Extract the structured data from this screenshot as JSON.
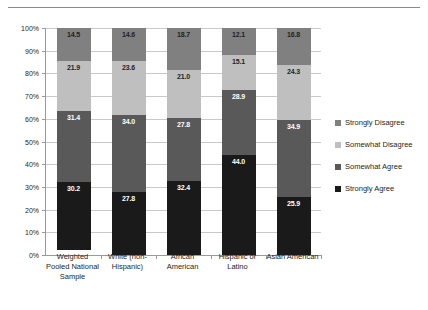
{
  "chart_data": {
    "type": "bar",
    "subtype": "stacked-100-percent-vertical",
    "title": "",
    "xlabel": "",
    "ylabel": "",
    "ylim": [
      0,
      100
    ],
    "ytick_labels": [
      "0%",
      "10%",
      "20%",
      "30%",
      "40%",
      "50%",
      "60%",
      "70%",
      "80%",
      "90%",
      "100%"
    ],
    "ytick_values": [
      0,
      10,
      20,
      30,
      40,
      50,
      60,
      70,
      80,
      90,
      100
    ],
    "grid": true,
    "legend_position": "right",
    "categories": [
      "Weighted Pooled National Sample",
      "White (non-Hispanic)",
      "African American",
      "Hispanic or Latino",
      "Asian American"
    ],
    "category_lines": [
      [
        "Weighted",
        "Pooled National",
        "Sample"
      ],
      [
        "White (non-",
        "Hispanic)"
      ],
      [
        "African",
        "American"
      ],
      [
        "Hispanic or",
        "Latino"
      ],
      [
        "Asian American"
      ]
    ],
    "series": [
      {
        "name": "Strongly Agree",
        "color": "#1a1a1a",
        "label_color": "light",
        "values": [
          30.2,
          27.8,
          32.4,
          44.0,
          25.9
        ]
      },
      {
        "name": "Somewhat Agree",
        "color": "#595959",
        "label_color": "light",
        "values": [
          31.4,
          34.0,
          27.8,
          28.9,
          34.9
        ]
      },
      {
        "name": "Somewhat Disagree",
        "color": "#bfbfbf",
        "label_color": "dark",
        "values": [
          21.9,
          23.6,
          21.0,
          15.1,
          24.3
        ]
      },
      {
        "name": "Strongly Disagree",
        "color": "#808080",
        "label_color": "dark",
        "values": [
          14.5,
          14.6,
          18.7,
          12.1,
          16.8
        ]
      }
    ],
    "legend_entries": [
      {
        "label": "Strongly Disagree",
        "color": "#808080"
      },
      {
        "label": "Somewhat Disagree",
        "color": "#bfbfbf"
      },
      {
        "label": "Somewhat Agree",
        "color": "#595959"
      },
      {
        "label": "Strongly Agree",
        "color": "#1a1a1a"
      }
    ]
  }
}
